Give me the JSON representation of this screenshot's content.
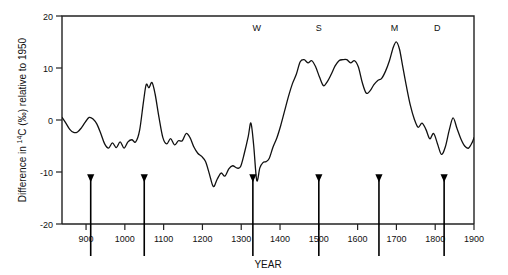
{
  "chart_data": {
    "type": "line",
    "title": "",
    "xlabel": "YEAR",
    "ylabel": "Difference in 14C (‰) relative to 1950",
    "ylabel_parts": {
      "prefix": "Difference in ",
      "superscript": "14",
      "element": "C (‰) relative to 1950"
    },
    "xlim": [
      838,
      1900
    ],
    "ylim": [
      20,
      -20
    ],
    "y_inverted": true,
    "grid": false,
    "legend": null,
    "xticks": [
      900,
      1000,
      1100,
      1200,
      1300,
      1400,
      1500,
      1600,
      1700,
      1800,
      1900
    ],
    "xtick_labels": [
      "900",
      "1000",
      "1100",
      "1200",
      "1300",
      "1400",
      "1500",
      "1600",
      "1700",
      "1800",
      "1900"
    ],
    "yticks": [
      -20,
      -10,
      0,
      10,
      20
    ],
    "ytick_labels": [
      "-20",
      "-10",
      "0",
      "10",
      "20"
    ],
    "series": [
      {
        "name": "Delta 14C",
        "x": [
          838,
          848,
          858,
          868,
          878,
          888,
          898,
          908,
          918,
          928,
          938,
          948,
          958,
          968,
          978,
          988,
          998,
          1008,
          1018,
          1028,
          1038,
          1048,
          1055,
          1062,
          1070,
          1078,
          1088,
          1098,
          1108,
          1118,
          1128,
          1138,
          1148,
          1158,
          1168,
          1178,
          1188,
          1198,
          1208,
          1218,
          1228,
          1238,
          1248,
          1258,
          1268,
          1278,
          1288,
          1298,
          1308,
          1318,
          1325,
          1332,
          1340,
          1348,
          1356,
          1364,
          1372,
          1382,
          1392,
          1402,
          1412,
          1422,
          1432,
          1442,
          1452,
          1462,
          1472,
          1482,
          1492,
          1502,
          1512,
          1522,
          1532,
          1542,
          1552,
          1562,
          1572,
          1582,
          1592,
          1602,
          1612,
          1622,
          1632,
          1642,
          1652,
          1662,
          1672,
          1682,
          1692,
          1700,
          1708,
          1716,
          1726,
          1736,
          1746,
          1756,
          1766,
          1776,
          1786,
          1796,
          1806,
          1816,
          1826,
          1836,
          1846,
          1856,
          1866,
          1876,
          1886,
          1896,
          1900
        ],
        "y": [
          0.5,
          -0.6,
          -1.8,
          -2.4,
          -2.3,
          -1.5,
          -0.4,
          0.5,
          0.2,
          -0.8,
          -2.6,
          -4.6,
          -5.4,
          -4.4,
          -5.3,
          -4.2,
          -5.4,
          -4.2,
          -3.8,
          -4.2,
          -2.0,
          3.5,
          6.8,
          6.2,
          7.2,
          5.0,
          0.5,
          -3.4,
          -4.6,
          -3.6,
          -4.8,
          -4.0,
          -4.0,
          -2.6,
          -3.4,
          -5.2,
          -6.4,
          -7.0,
          -8.0,
          -10.4,
          -12.8,
          -11.4,
          -10.2,
          -10.8,
          -9.4,
          -8.8,
          -9.2,
          -9.0,
          -6.4,
          -3.2,
          -0.6,
          -4.8,
          -11.6,
          -9.2,
          -8.2,
          -8.0,
          -7.4,
          -5.2,
          -3.4,
          -1.0,
          1.8,
          4.6,
          7.0,
          8.8,
          11.2,
          11.6,
          11.0,
          11.4,
          10.2,
          8.2,
          6.6,
          7.4,
          8.8,
          10.4,
          11.4,
          11.6,
          11.6,
          11.0,
          11.4,
          10.2,
          7.2,
          5.2,
          5.6,
          6.8,
          7.6,
          8.0,
          9.4,
          11.4,
          14.0,
          15.0,
          13.6,
          10.4,
          6.4,
          2.8,
          0.2,
          -1.4,
          -0.6,
          -1.8,
          -3.6,
          -2.6,
          -4.6,
          -6.6,
          -5.2,
          -2.0,
          0.4,
          -1.6,
          -3.6,
          -5.0,
          -5.4,
          -4.2,
          -3.4
        ]
      }
    ],
    "annotations": [
      {
        "label": "W",
        "x": 1340,
        "y": 17.2,
        "name": "wolf-minimum-label"
      },
      {
        "label": "S",
        "x": 1500,
        "y": 17.2,
        "name": "sporer-minimum-label"
      },
      {
        "label": "M",
        "x": 1695,
        "y": 17.2,
        "name": "maunder-minimum-label"
      },
      {
        "label": "D",
        "x": 1805,
        "y": 17.2,
        "name": "dalton-minimum-label"
      }
    ],
    "arrows": [
      {
        "x": 912,
        "y_top": -20.0,
        "y_tip": -11.8,
        "name": "arrow-marker-1"
      },
      {
        "x": 1050,
        "y_top": -20.0,
        "y_tip": -11.8,
        "name": "arrow-marker-2"
      },
      {
        "x": 1330,
        "y_top": -20.0,
        "y_tip": -11.8,
        "name": "arrow-marker-3"
      },
      {
        "x": 1500,
        "y_top": -20.0,
        "y_tip": -11.8,
        "name": "arrow-marker-4"
      },
      {
        "x": 1655,
        "y_top": -20.0,
        "y_tip": -11.8,
        "name": "arrow-marker-5"
      },
      {
        "x": 1823,
        "y_top": -20.0,
        "y_tip": -11.8,
        "name": "arrow-marker-6"
      }
    ],
    "colors": {
      "curve": "#111111",
      "axis": "#222222",
      "text": "#111111",
      "background": "#ffffff"
    }
  }
}
